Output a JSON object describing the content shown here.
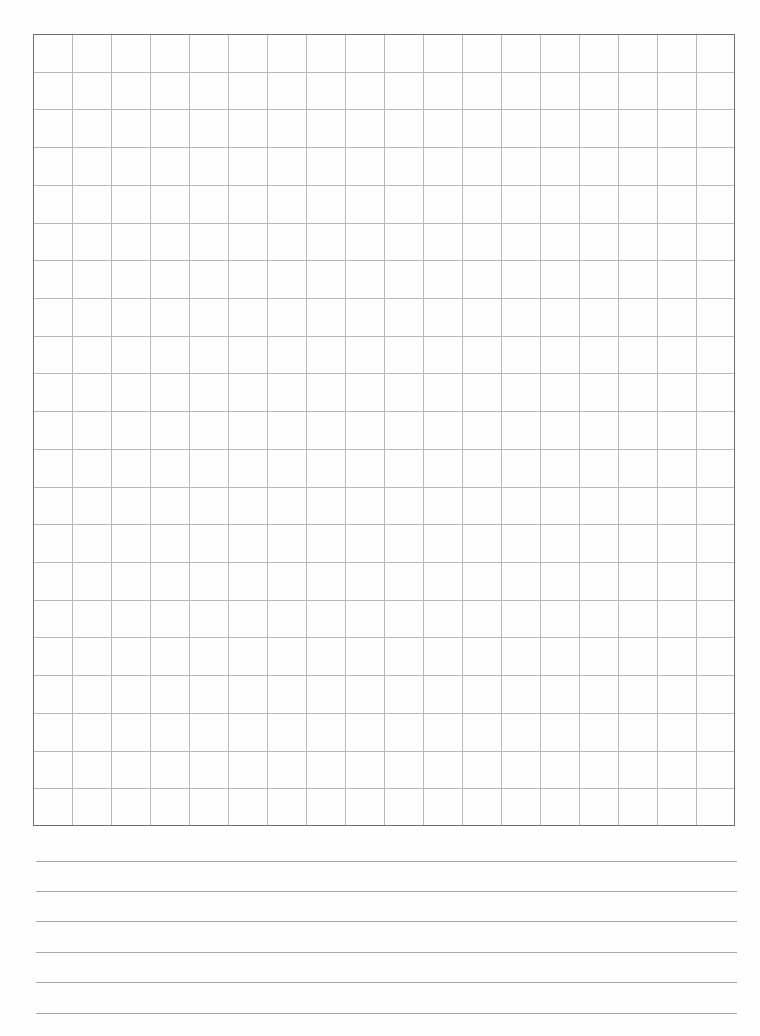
{
  "page": {
    "type": "grid-paper-with-ruled-lines",
    "background": "#fefefe"
  },
  "grid": {
    "left": 33,
    "top": 34,
    "width": 702,
    "height": 792,
    "columns": 18,
    "rows": 21,
    "border_color": "#6e6e6e",
    "line_color": "#b9b9b9"
  },
  "ruled_lines": {
    "left": 36,
    "right": 737,
    "y_positions": [
      861,
      891,
      921,
      952,
      982,
      1013
    ],
    "color": "#a8a8a8"
  }
}
